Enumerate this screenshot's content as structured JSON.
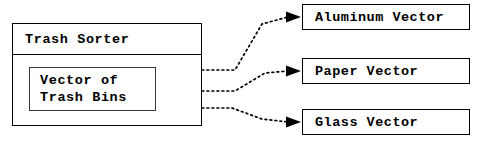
{
  "diagram": {
    "type": "composition-diagram",
    "background_color": "#ffffff",
    "line_color": "#000000",
    "container": {
      "title": "Trash Sorter",
      "inner": {
        "line1": "Vector of",
        "line2": "Trash Bins",
        "ports": [
          {
            "name": "port-aluminum",
            "x": 155,
            "y": 70
          },
          {
            "name": "port-paper",
            "x": 155,
            "y": 91
          },
          {
            "name": "port-glass",
            "x": 155,
            "y": 108
          }
        ]
      }
    },
    "targets": [
      {
        "id": "aluminum",
        "label": "Aluminum Vector"
      },
      {
        "id": "paper",
        "label": "Paper Vector"
      },
      {
        "id": "glass",
        "label": "Glass Vector"
      }
    ],
    "connectors": [
      {
        "name": "connector-aluminum",
        "style": "dotted",
        "arrowhead": "filled",
        "from_port": 0,
        "to_target": "aluminum"
      },
      {
        "name": "connector-paper",
        "style": "dotted",
        "arrowhead": "filled",
        "from_port": 1,
        "to_target": "paper"
      },
      {
        "name": "connector-glass",
        "style": "dotted",
        "arrowhead": "filled",
        "from_port": 2,
        "to_target": "glass"
      }
    ]
  }
}
